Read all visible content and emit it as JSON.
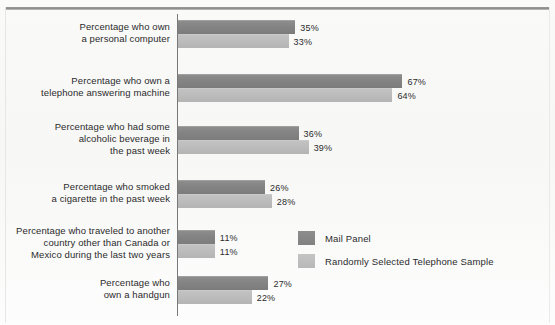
{
  "chart_data": {
    "type": "bar",
    "orientation": "horizontal",
    "title": "",
    "subtitle": "",
    "xlabel": "",
    "ylabel": "",
    "xlim": [
      0,
      70
    ],
    "grid": false,
    "legend_position": "middle-right",
    "value_suffix": "%",
    "categories": [
      "Percentage who own\na personal computer",
      "Percentage who own a\ntelephone answering machine",
      "Percentage who had some\nalcoholic beverage in\nthe past week",
      "Percentage who smoked\na cigarette in the past week",
      "Percentage who traveled to another\ncountry other than Canada or\nMexico during the last two years",
      "Percentage who\nown a handgun"
    ],
    "series": [
      {
        "name": "Mail Panel",
        "color": "#848484",
        "values": [
          35,
          67,
          36,
          26,
          11,
          27
        ],
        "labels": [
          "35%",
          "67%",
          "36%",
          "26%",
          "11%",
          "27%"
        ]
      },
      {
        "name": "Randomly Selected Telephone Sample",
        "color": "#bcbcbc",
        "values": [
          33,
          64,
          39,
          28,
          11,
          22
        ],
        "labels": [
          "33%",
          "64%",
          "39%",
          "28%",
          "11%",
          "22%"
        ]
      }
    ]
  },
  "legend": {
    "items": [
      {
        "label": "Mail Panel",
        "color": "#848484"
      },
      {
        "label": "Randomly Selected Telephone Sample",
        "color": "#bcbcbc"
      }
    ]
  }
}
